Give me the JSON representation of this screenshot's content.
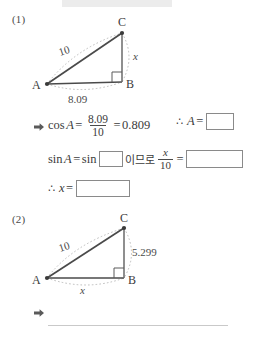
{
  "page": {
    "background": "#ffffff",
    "ink_color": "#3c3c3c",
    "box_border_color": "#8a8a8a",
    "dash_color": "#b0b0b0"
  },
  "problems": [
    {
      "number": "(1)",
      "figure": {
        "vertices": [
          {
            "label": "A",
            "x": 27,
            "y": 70
          },
          {
            "label": "B",
            "x": 102,
            "y": 68
          },
          {
            "label": "C",
            "x": 102,
            "y": 19
          }
        ],
        "right_angle_at": "B",
        "side_labels": [
          {
            "text": "10",
            "side": "AC"
          },
          {
            "text": "8.09",
            "side": "AB"
          },
          {
            "text": "x",
            "side": "BC",
            "italic": true
          }
        ]
      },
      "steps": [
        {
          "bullet": "arrow-right-icon",
          "expression": {
            "fn": "cos",
            "angle": "A",
            "eq1": "=",
            "fraction": {
              "numerator": "8.09",
              "denominator": "10"
            },
            "eq2": "=",
            "value": "0.809"
          },
          "conclusion": {
            "symbol": "∴",
            "lhs": "A",
            "eq": "=",
            "answer_box": ""
          }
        },
        {
          "lhs_fn": "sin",
          "lhs_angle": "A",
          "eq": "=",
          "rhs_fn": "sin",
          "rhs_box": "",
          "korean_connector": "이므로",
          "fraction": {
            "numerator": "x",
            "denominator": "10"
          },
          "eq2": "=",
          "answer_box": ""
        },
        {
          "symbol": "∴",
          "lhs": "x",
          "eq": "=",
          "answer_box": ""
        }
      ]
    },
    {
      "number": "(2)",
      "figure": {
        "vertices": [
          {
            "label": "A",
            "x": 27,
            "y": 64
          },
          {
            "label": "B",
            "x": 104,
            "y": 64
          },
          {
            "label": "C",
            "x": 104,
            "y": 14
          }
        ],
        "right_angle_at": "B",
        "side_labels": [
          {
            "text": "10",
            "side": "AC"
          },
          {
            "text": "5.299",
            "side": "BC"
          },
          {
            "text": "x",
            "side": "AB",
            "italic": true
          }
        ]
      },
      "answer": {
        "bullet": "arrow-right-icon",
        "text": "",
        "rule": true
      }
    }
  ]
}
